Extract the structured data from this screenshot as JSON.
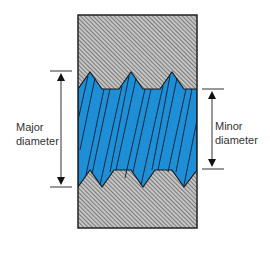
{
  "diagram": {
    "labels": {
      "major": [
        "Major",
        "diameter"
      ],
      "minor": [
        "Minor",
        "diameter"
      ]
    },
    "colors": {
      "thread": "#1e8fd6",
      "hatch_bg": "#bfbfbf",
      "hatch_line": "#555555",
      "outline": "#222222",
      "dimension": "#333333",
      "background": "#ffffff"
    },
    "elements": [
      {
        "id": "nut-body",
        "kind": "hatched-section"
      },
      {
        "id": "screw-thread",
        "kind": "blue-threaded-shaft"
      },
      {
        "id": "major-diameter-dimension",
        "kind": "dimension-arrow"
      },
      {
        "id": "minor-diameter-dimension",
        "kind": "dimension-arrow"
      }
    ]
  }
}
